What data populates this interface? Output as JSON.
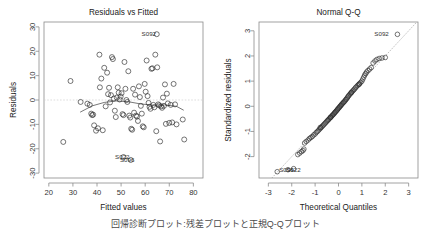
{
  "figure": {
    "background": "#ffffff",
    "point_color": "#2b2b2b",
    "frame_color": "#8a8a8a",
    "guide_color": "#cfcfcf",
    "caption": "回帰診断プロット:残差プロットと正規Q-Qプロット"
  },
  "chart_data": [
    {
      "type": "scatter",
      "title": "Residuals vs Fitted",
      "xlabel": "Fitted values",
      "ylabel": "Residuals",
      "xlim": [
        18,
        84
      ],
      "ylim": [
        -32,
        32
      ],
      "xticks": [
        20,
        30,
        40,
        50,
        60,
        70,
        80
      ],
      "yticks": [
        -30,
        -20,
        -10,
        0,
        10,
        20,
        30
      ],
      "grid": false,
      "legend": "none",
      "reference_line": {
        "kind": "horizontal",
        "y": 0,
        "style": "dotted"
      },
      "smoother": {
        "name": "loess",
        "x": [
          33,
          38,
          43,
          48,
          53,
          58,
          63,
          68,
          73,
          76
        ],
        "y": [
          -5.0,
          -2.4,
          -1.0,
          -0.4,
          -0.7,
          -1.6,
          -2.1,
          -2.0,
          -2.6,
          -4.2
        ]
      },
      "annotations": [
        {
          "label": "S092",
          "x": 64.5,
          "y": 27.0
        },
        {
          "label": "S022",
          "x": 53.5,
          "y": -23.4
        },
        {
          "label": "S096",
          "x": 55.5,
          "y": -24.6
        }
      ],
      "points": [
        {
          "x": 26.0,
          "y": -17.2
        },
        {
          "x": 29.0,
          "y": 7.8
        },
        {
          "x": 33.2,
          "y": -0.8
        },
        {
          "x": 36.0,
          "y": -1.5
        },
        {
          "x": 37.0,
          "y": -2.0
        },
        {
          "x": 37.6,
          "y": -5.6
        },
        {
          "x": 38.0,
          "y": -6.2
        },
        {
          "x": 38.4,
          "y": -6.0
        },
        {
          "x": 38.8,
          "y": -10.4
        },
        {
          "x": 39.6,
          "y": -12.6
        },
        {
          "x": 40.4,
          "y": -11.6
        },
        {
          "x": 41.0,
          "y": 18.6
        },
        {
          "x": 41.2,
          "y": 5.2
        },
        {
          "x": 41.8,
          "y": 8.8
        },
        {
          "x": 42.4,
          "y": -12.4
        },
        {
          "x": 43.0,
          "y": 13.2
        },
        {
          "x": 43.6,
          "y": -2.6
        },
        {
          "x": 44.2,
          "y": 11.2
        },
        {
          "x": 44.6,
          "y": 2.4
        },
        {
          "x": 45.0,
          "y": 5.0
        },
        {
          "x": 45.4,
          "y": -1.0
        },
        {
          "x": 45.8,
          "y": 2.0
        },
        {
          "x": 46.2,
          "y": 17.6
        },
        {
          "x": 46.6,
          "y": 16.8
        },
        {
          "x": 47.0,
          "y": 0.6
        },
        {
          "x": 47.4,
          "y": -4.4
        },
        {
          "x": 47.8,
          "y": -7.0
        },
        {
          "x": 48.2,
          "y": 1.0
        },
        {
          "x": 48.6,
          "y": 5.2
        },
        {
          "x": 49.0,
          "y": 3.0
        },
        {
          "x": 49.4,
          "y": 0.2
        },
        {
          "x": 49.8,
          "y": 1.4
        },
        {
          "x": 50.2,
          "y": 2.8
        },
        {
          "x": 50.6,
          "y": -5.8
        },
        {
          "x": 51.0,
          "y": -6.2
        },
        {
          "x": 51.4,
          "y": 15.6
        },
        {
          "x": 51.8,
          "y": 4.6
        },
        {
          "x": 52.2,
          "y": 0.0
        },
        {
          "x": 52.6,
          "y": -0.8
        },
        {
          "x": 53.0,
          "y": 11.8
        },
        {
          "x": 53.4,
          "y": -6.4
        },
        {
          "x": 53.8,
          "y": -7.2
        },
        {
          "x": 54.2,
          "y": -11.8
        },
        {
          "x": 54.6,
          "y": -12.2
        },
        {
          "x": 55.0,
          "y": 4.6
        },
        {
          "x": 55.4,
          "y": -5.2
        },
        {
          "x": 55.8,
          "y": 2.2
        },
        {
          "x": 56.2,
          "y": -6.4
        },
        {
          "x": 56.6,
          "y": -6.8
        },
        {
          "x": 57.0,
          "y": -8.6
        },
        {
          "x": 57.4,
          "y": 5.6
        },
        {
          "x": 57.8,
          "y": 1.2
        },
        {
          "x": 58.2,
          "y": -2.4
        },
        {
          "x": 58.6,
          "y": -5.6
        },
        {
          "x": 59.0,
          "y": -10.8
        },
        {
          "x": 59.4,
          "y": -11.2
        },
        {
          "x": 59.8,
          "y": 6.6
        },
        {
          "x": 60.2,
          "y": 3.4
        },
        {
          "x": 60.6,
          "y": 16.2
        },
        {
          "x": 61.0,
          "y": 1.6
        },
        {
          "x": 61.4,
          "y": -1.2
        },
        {
          "x": 61.8,
          "y": -2.8
        },
        {
          "x": 62.2,
          "y": -3.6
        },
        {
          "x": 62.6,
          "y": 12.8
        },
        {
          "x": 63.0,
          "y": 13.0
        },
        {
          "x": 63.4,
          "y": -2.0
        },
        {
          "x": 63.8,
          "y": -3.0
        },
        {
          "x": 64.2,
          "y": 18.6
        },
        {
          "x": 64.6,
          "y": -12.8
        },
        {
          "x": 65.0,
          "y": 13.4
        },
        {
          "x": 65.4,
          "y": -1.8
        },
        {
          "x": 65.8,
          "y": -2.2
        },
        {
          "x": 66.2,
          "y": -17.0
        },
        {
          "x": 66.6,
          "y": -2.6
        },
        {
          "x": 67.0,
          "y": -3.2
        },
        {
          "x": 67.4,
          "y": 1.0
        },
        {
          "x": 67.8,
          "y": -2.4
        },
        {
          "x": 68.2,
          "y": 6.4
        },
        {
          "x": 68.6,
          "y": -9.8
        },
        {
          "x": 69.0,
          "y": 2.6
        },
        {
          "x": 69.4,
          "y": -1.4
        },
        {
          "x": 70.0,
          "y": -9.4
        },
        {
          "x": 70.6,
          "y": -2.0
        },
        {
          "x": 71.2,
          "y": -9.2
        },
        {
          "x": 71.8,
          "y": 6.6
        },
        {
          "x": 72.4,
          "y": -1.8
        },
        {
          "x": 73.0,
          "y": -10.0
        },
        {
          "x": 75.6,
          "y": -8.0
        },
        {
          "x": 76.2,
          "y": -16.2
        },
        {
          "x": 64.8,
          "y": 27.0
        },
        {
          "x": 51.0,
          "y": -23.4
        },
        {
          "x": 54.0,
          "y": -24.6
        }
      ]
    },
    {
      "type": "scatter",
      "title": "Normal Q-Q",
      "xlabel": "Theoretical Quantiles",
      "ylabel": "Standardized residuals",
      "xlim": [
        -3.4,
        3.4
      ],
      "ylim": [
        -2.85,
        3.35
      ],
      "xticks": [
        -3,
        -2,
        -1,
        0,
        1,
        2,
        3
      ],
      "yticks": [
        -2,
        -1,
        0,
        1,
        2,
        3
      ],
      "grid": false,
      "legend": "none",
      "reference_line": {
        "kind": "qqline",
        "slope": 1.0,
        "intercept": 0.0,
        "style": "dotted"
      },
      "annotations": [
        {
          "label": "S092",
          "x": 2.15,
          "y": 2.88
        },
        {
          "label": "S096",
          "x": -1.92,
          "y": -2.52
        },
        {
          "label": "S022",
          "x": -1.62,
          "y": -2.52
        }
      ],
      "points": [
        {
          "x": -2.62,
          "y": -2.6
        },
        {
          "x": -2.16,
          "y": -2.52
        },
        {
          "x": -1.92,
          "y": -2.48
        },
        {
          "x": -1.74,
          "y": -1.92
        },
        {
          "x": -1.66,
          "y": -1.86
        },
        {
          "x": -1.58,
          "y": -1.8
        },
        {
          "x": -1.45,
          "y": -1.46
        },
        {
          "x": -1.38,
          "y": -1.4
        },
        {
          "x": -1.3,
          "y": -1.34
        },
        {
          "x": -1.24,
          "y": -1.28
        },
        {
          "x": -1.18,
          "y": -1.24
        },
        {
          "x": -1.12,
          "y": -1.2
        },
        {
          "x": -1.06,
          "y": -1.14
        },
        {
          "x": -1.0,
          "y": -1.1
        },
        {
          "x": -0.95,
          "y": -1.04
        },
        {
          "x": -0.9,
          "y": -1.0
        },
        {
          "x": -0.85,
          "y": -0.95
        },
        {
          "x": -0.8,
          "y": -0.9
        },
        {
          "x": -0.76,
          "y": -0.86
        },
        {
          "x": -0.72,
          "y": -0.82
        },
        {
          "x": -0.68,
          "y": -0.78
        },
        {
          "x": -0.64,
          "y": -0.74
        },
        {
          "x": -0.6,
          "y": -0.7
        },
        {
          "x": -0.56,
          "y": -0.66
        },
        {
          "x": -0.52,
          "y": -0.62
        },
        {
          "x": -0.48,
          "y": -0.58
        },
        {
          "x": -0.45,
          "y": -0.55
        },
        {
          "x": -0.42,
          "y": -0.52
        },
        {
          "x": -0.38,
          "y": -0.48
        },
        {
          "x": -0.35,
          "y": -0.45
        },
        {
          "x": -0.32,
          "y": -0.42
        },
        {
          "x": -0.29,
          "y": -0.39
        },
        {
          "x": -0.26,
          "y": -0.36
        },
        {
          "x": -0.23,
          "y": -0.33
        },
        {
          "x": -0.2,
          "y": -0.3
        },
        {
          "x": -0.17,
          "y": -0.27
        },
        {
          "x": -0.15,
          "y": -0.24
        },
        {
          "x": -0.12,
          "y": -0.21
        },
        {
          "x": -0.09,
          "y": -0.18
        },
        {
          "x": -0.06,
          "y": -0.15
        },
        {
          "x": -0.04,
          "y": -0.12
        },
        {
          "x": -0.01,
          "y": -0.09
        },
        {
          "x": 0.02,
          "y": -0.06
        },
        {
          "x": 0.04,
          "y": -0.03
        },
        {
          "x": 0.07,
          "y": 0.0
        },
        {
          "x": 0.1,
          "y": 0.03
        },
        {
          "x": 0.12,
          "y": 0.06
        },
        {
          "x": 0.15,
          "y": 0.09
        },
        {
          "x": 0.18,
          "y": 0.12
        },
        {
          "x": 0.21,
          "y": 0.15
        },
        {
          "x": 0.24,
          "y": 0.18
        },
        {
          "x": 0.27,
          "y": 0.21
        },
        {
          "x": 0.3,
          "y": 0.25
        },
        {
          "x": 0.33,
          "y": 0.28
        },
        {
          "x": 0.36,
          "y": 0.32
        },
        {
          "x": 0.39,
          "y": 0.36
        },
        {
          "x": 0.42,
          "y": 0.4
        },
        {
          "x": 0.45,
          "y": 0.44
        },
        {
          "x": 0.49,
          "y": 0.48
        },
        {
          "x": 0.52,
          "y": 0.52
        },
        {
          "x": 0.56,
          "y": 0.56
        },
        {
          "x": 0.6,
          "y": 0.6
        },
        {
          "x": 0.64,
          "y": 0.64
        },
        {
          "x": 0.68,
          "y": 0.68
        },
        {
          "x": 0.72,
          "y": 0.73
        },
        {
          "x": 0.76,
          "y": 0.77
        },
        {
          "x": 0.81,
          "y": 0.82
        },
        {
          "x": 0.86,
          "y": 0.86
        },
        {
          "x": 0.9,
          "y": 0.9
        },
        {
          "x": 0.95,
          "y": 0.95
        },
        {
          "x": 1.0,
          "y": 1.0
        },
        {
          "x": 1.04,
          "y": 1.08
        },
        {
          "x": 1.08,
          "y": 1.16
        },
        {
          "x": 1.12,
          "y": 1.24
        },
        {
          "x": 1.16,
          "y": 1.3
        },
        {
          "x": 1.2,
          "y": 1.36
        },
        {
          "x": 1.26,
          "y": 1.42
        },
        {
          "x": 1.33,
          "y": 1.48
        },
        {
          "x": 1.4,
          "y": 1.54
        },
        {
          "x": 1.48,
          "y": 1.72
        },
        {
          "x": 1.56,
          "y": 1.8
        },
        {
          "x": 1.64,
          "y": 1.86
        },
        {
          "x": 1.74,
          "y": 1.9
        },
        {
          "x": 1.86,
          "y": 1.92
        },
        {
          "x": 2.0,
          "y": 1.94
        },
        {
          "x": 2.52,
          "y": 2.86
        },
        {
          "x": -1.52,
          "y": -1.76
        },
        {
          "x": -1.48,
          "y": -1.7
        },
        {
          "x": 0.88,
          "y": 0.88
        },
        {
          "x": -0.34,
          "y": -0.44
        },
        {
          "x": 0.55,
          "y": 0.54
        },
        {
          "x": -0.78,
          "y": -0.84
        }
      ]
    }
  ]
}
